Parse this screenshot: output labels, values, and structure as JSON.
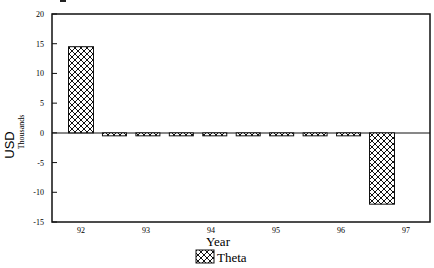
{
  "chart_data": {
    "type": "bar",
    "title": "",
    "categories": [
      "92",
      "",
      "",
      "",
      "",
      "",
      "",
      "",
      "",
      "97"
    ],
    "x_tick_labels": [
      "92",
      "93",
      "94",
      "95",
      "96",
      "97"
    ],
    "series": [
      {
        "name": "Theta",
        "values": [
          14.5,
          -0.5,
          -0.5,
          -0.5,
          -0.5,
          -0.5,
          -0.5,
          -0.5,
          -0.5,
          -12
        ]
      }
    ],
    "xlabel": "Year",
    "ylabel": "USD",
    "y_units": "Thousands",
    "ylim": [
      -15,
      20
    ],
    "y_ticks": [
      20,
      15,
      10,
      5,
      0,
      -5,
      -10,
      -15
    ],
    "grid": false,
    "legend_position": "bottom",
    "pattern": "crosshatch"
  },
  "labels": {
    "ylabel": "USD",
    "units": "Thousands",
    "xlabel": "Year",
    "legend": "Theta"
  }
}
